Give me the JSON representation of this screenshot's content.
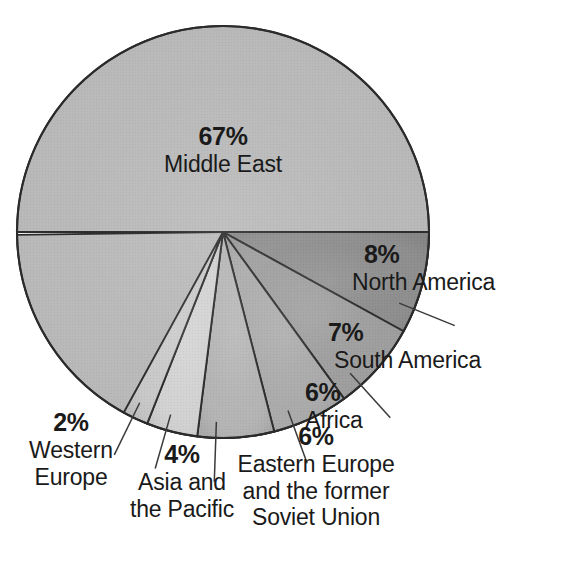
{
  "chart_data": {
    "type": "pie",
    "title": "",
    "subtitle": "",
    "xlabel": "",
    "ylabel": "",
    "legend_position": "none",
    "grid": false,
    "unit": "%",
    "total": 100,
    "categories": [
      "Middle East",
      "North America",
      "South America",
      "Africa",
      "Eastern Europe and the former Soviet Union",
      "Asia and the Pacific",
      "Western Europe"
    ],
    "values": [
      67,
      8,
      7,
      6,
      6,
      4,
      2
    ],
    "slices": [
      {
        "label": "Middle East",
        "label_lines": [
          "Middle East"
        ],
        "percent_text": "67%",
        "value": 67,
        "color": "#b9b9b9",
        "color_edge": "#b2b2b2",
        "start_angle": 180,
        "end_angle": 539.2,
        "label_placement": "inside",
        "leader": false
      },
      {
        "label": "North America",
        "label_lines": [
          "North America"
        ],
        "percent_text": "8%",
        "value": 8,
        "color": "#8d8d8d",
        "color_edge": "#7e7e7e",
        "start_angle": 0,
        "end_angle": 28.8,
        "label_placement": "outside",
        "leader": true
      },
      {
        "label": "South America",
        "label_lines": [
          "South America"
        ],
        "percent_text": "7%",
        "value": 7,
        "color": "#9d9d9d",
        "color_edge": "#909090",
        "start_angle": 28.8,
        "end_angle": 54.0,
        "label_placement": "outside",
        "leader": true
      },
      {
        "label": "Africa",
        "label_lines": [
          "Africa"
        ],
        "percent_text": "6%",
        "value": 6,
        "color": "#aaaaaa",
        "color_edge": "#9e9e9e",
        "start_angle": 54.0,
        "end_angle": 75.6,
        "label_placement": "outside",
        "leader": true
      },
      {
        "label": "Eastern Europe and the former Soviet Union",
        "label_lines": [
          "Eastern Europe",
          "and the former",
          "Soviet Union"
        ],
        "percent_text": "6%",
        "value": 6,
        "color": "#b4b4b4",
        "color_edge": "#a8a8a8",
        "start_angle": 75.6,
        "end_angle": 97.2,
        "label_placement": "outside",
        "leader": true
      },
      {
        "label": "Asia and the Pacific",
        "label_lines": [
          "Asia and",
          "the Pacific"
        ],
        "percent_text": "4%",
        "value": 4,
        "color": "#d2d2d2",
        "color_edge": "#c4c4c4",
        "start_angle": 97.2,
        "end_angle": 111.6,
        "label_placement": "outside",
        "leader": true
      },
      {
        "label": "Western Europe",
        "label_lines": [
          "Western",
          "Europe"
        ],
        "percent_text": "2%",
        "value": 2,
        "color": "#c8c8c8",
        "color_edge": "#bbbbbb",
        "start_angle": 111.6,
        "end_angle": 118.8,
        "label_placement": "outside",
        "leader": true
      }
    ]
  },
  "labels": {
    "middle_east": {
      "percent": "67%",
      "line1": "Middle East"
    },
    "north_america": {
      "percent": "8%",
      "line1": "North America"
    },
    "south_america": {
      "percent": "7%",
      "line1": "South America"
    },
    "africa": {
      "percent": "6%",
      "line1": "Africa"
    },
    "eastern_europe": {
      "percent": "6%",
      "line1": "Eastern Europe",
      "line2": "and the former",
      "line3": "Soviet Union"
    },
    "asia_pacific": {
      "percent": "4%",
      "line1": "Asia and",
      "line2": "the Pacific"
    },
    "western_europe": {
      "percent": "2%",
      "line1": "Western",
      "line2": "Europe"
    }
  },
  "geometry": {
    "center_x": 223,
    "center_y": 232,
    "radius": 206
  },
  "colors": {
    "background": "#ffffff",
    "outline": "#2b2b2b",
    "text": "#1a1a1a",
    "leader_line": "#3a3a3a"
  }
}
